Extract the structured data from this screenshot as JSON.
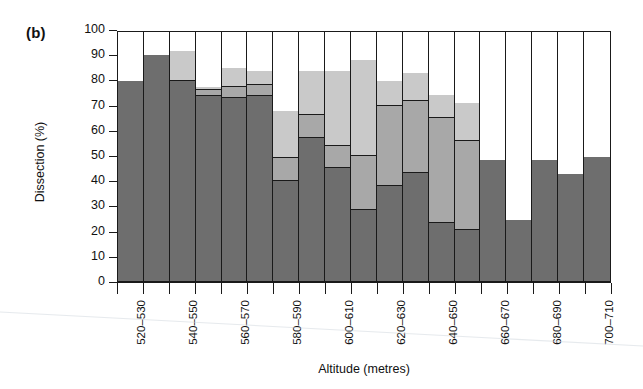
{
  "figure": {
    "panel_label": "(b)",
    "xlabel": "Altitude (metres)",
    "ylabel": "Dissection (%)"
  },
  "chart_data": {
    "type": "bar",
    "subtype": "stacked-100-percent",
    "title": "(b)",
    "xlabel": "Altitude (metres)",
    "ylabel": "Dissection (%)",
    "ylim": [
      0,
      100
    ],
    "yticks": [
      0,
      10,
      20,
      30,
      40,
      50,
      60,
      70,
      80,
      90,
      100
    ],
    "grid": false,
    "legend": "none",
    "bar_count": 19,
    "categories": [
      "520-530",
      "530-540",
      "540-550",
      "550-560",
      "560-570",
      "570-580",
      "580-590",
      "590-600",
      "600-610",
      "610-620",
      "620-630",
      "630-640",
      "640-650",
      "650-660",
      "660-670",
      "670-680",
      "680-690",
      "690-700",
      "700-710"
    ],
    "tick_labels": [
      "520–530",
      "",
      "540–550",
      "",
      "560–570",
      "",
      "580–590",
      "",
      "600–610",
      "",
      "620–630",
      "",
      "640–650",
      "",
      "660–670",
      "",
      "680–690",
      "",
      "700–710"
    ],
    "series": [
      {
        "name": "class-1",
        "color": "#6e6e6e",
        "values": [
          80.5,
          91.0,
          80.5,
          74.5,
          73.5,
          74.5,
          40.5,
          57.5,
          45.5,
          29.0,
          38.5,
          43.5,
          23.5,
          21.0,
          49.0,
          25.0,
          49.0,
          43.0,
          50.0
        ]
      },
      {
        "name": "class-2",
        "color": "#a8a8a8",
        "values": [
          0.0,
          0.0,
          0.0,
          2.5,
          4.5,
          4.5,
          9.0,
          9.5,
          9.0,
          21.5,
          32.0,
          29.0,
          42.0,
          35.5,
          0.0,
          0.0,
          0.0,
          0.0,
          0.0
        ]
      },
      {
        "name": "class-3",
        "color": "#c9c9c9",
        "values": [
          0.0,
          0.0,
          12.0,
          1.0,
          7.5,
          5.5,
          19.0,
          17.5,
          30.0,
          38.5,
          10.0,
          11.0,
          9.5,
          15.0,
          0.0,
          0.0,
          0.0,
          0.0,
          0.0
        ]
      },
      {
        "name": "class-4",
        "color": "#ffffff",
        "values": [
          19.5,
          9.0,
          7.5,
          22.0,
          14.5,
          15.5,
          31.5,
          15.5,
          15.5,
          11.0,
          19.5,
          16.5,
          25.0,
          28.5,
          51.0,
          75.0,
          51.0,
          57.0,
          50.0
        ]
      }
    ],
    "stack_tops": [
      [
        80.5,
        80.5,
        80.5,
        100
      ],
      [
        91.0,
        91.0,
        91.0,
        100
      ],
      [
        80.5,
        80.5,
        92.5,
        100
      ],
      [
        74.5,
        77.0,
        78.0,
        100
      ],
      [
        73.5,
        78.0,
        85.5,
        100
      ],
      [
        74.5,
        79.0,
        84.5,
        100
      ],
      [
        40.5,
        49.5,
        68.5,
        100
      ],
      [
        57.5,
        67.0,
        84.5,
        100
      ],
      [
        45.5,
        54.5,
        84.5,
        100
      ],
      [
        29.0,
        50.5,
        89.0,
        100
      ],
      [
        38.5,
        70.5,
        80.5,
        100
      ],
      [
        43.5,
        72.5,
        83.5,
        100
      ],
      [
        23.5,
        65.5,
        75.0,
        100
      ],
      [
        21.0,
        56.5,
        71.5,
        100
      ],
      [
        49.0,
        49.0,
        49.0,
        100
      ],
      [
        25.0,
        25.0,
        25.0,
        100
      ],
      [
        49.0,
        49.0,
        49.0,
        100
      ],
      [
        43.0,
        43.0,
        43.0,
        100
      ],
      [
        50.0,
        50.0,
        50.0,
        100
      ]
    ]
  },
  "colors": {
    "axis": "#1a1a1a",
    "dark_gray": "#6e6e6e",
    "mid_gray": "#a8a8a8",
    "light_gray": "#c9c9c9",
    "white": "#ffffff"
  }
}
